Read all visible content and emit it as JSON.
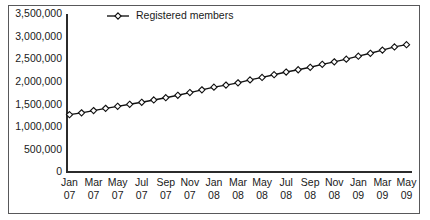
{
  "chart_data": {
    "type": "line",
    "title": "",
    "subtitle": "",
    "xlabel": "",
    "ylabel": "",
    "grid": false,
    "legend_position": "top-center",
    "ylim": [
      0,
      3500000
    ],
    "ytick_values": [
      0,
      500000,
      1000000,
      1500000,
      2000000,
      2500000,
      3000000,
      3500000
    ],
    "ytick_labels": [
      "0",
      "500,000",
      "1,000,000",
      "1,500,000",
      "2,000,000",
      "2,500,000",
      "3,000,000",
      "3,500,000"
    ],
    "x": [
      "Jan 07",
      "Feb 07",
      "Mar 07",
      "Apr 07",
      "May 07",
      "Jun 07",
      "Jul 07",
      "Aug 07",
      "Sep 07",
      "Oct 07",
      "Nov 07",
      "Dec 07",
      "Jan 08",
      "Feb 08",
      "Mar 08",
      "Apr 08",
      "May 08",
      "Jun 08",
      "Jul 08",
      "Aug 08",
      "Sep 08",
      "Oct 08",
      "Nov 08",
      "Dec 08",
      "Jan 09",
      "Feb 09",
      "Mar 09",
      "Apr 09",
      "May 09"
    ],
    "xtick_labels": [
      {
        "month": "Jan",
        "year": "07"
      },
      {
        "month": "Mar",
        "year": "07"
      },
      {
        "month": "May",
        "year": "07"
      },
      {
        "month": "Jul",
        "year": "07"
      },
      {
        "month": "Sep",
        "year": "07"
      },
      {
        "month": "Nov",
        "year": "07"
      },
      {
        "month": "Jan",
        "year": "08"
      },
      {
        "month": "Mar",
        "year": "08"
      },
      {
        "month": "May",
        "year": "08"
      },
      {
        "month": "Jul",
        "year": "08"
      },
      {
        "month": "Sep",
        "year": "08"
      },
      {
        "month": "Nov",
        "year": "08"
      },
      {
        "month": "Jan",
        "year": "09"
      },
      {
        "month": "Mar",
        "year": "09"
      },
      {
        "month": "May",
        "year": "09"
      }
    ],
    "series": [
      {
        "name": "Registered members",
        "marker": "diamond-open",
        "color": "#111111",
        "values": [
          1270000,
          1310000,
          1360000,
          1410000,
          1455000,
          1500000,
          1545000,
          1595000,
          1645000,
          1700000,
          1760000,
          1820000,
          1880000,
          1925000,
          1975000,
          2040000,
          2095000,
          2155000,
          2215000,
          2265000,
          2320000,
          2385000,
          2440000,
          2500000,
          2565000,
          2630000,
          2700000,
          2770000,
          2820000
        ]
      }
    ]
  },
  "legend": {
    "entries": [
      {
        "label": "Registered members"
      }
    ]
  }
}
